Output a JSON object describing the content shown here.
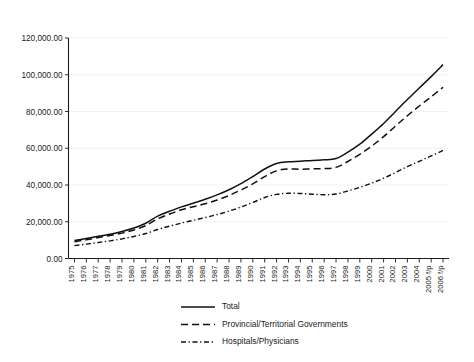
{
  "chart_data": {
    "type": "line",
    "title": "",
    "subtitle": "",
    "xlabel": "",
    "ylabel": "",
    "grid": "horizontal",
    "legend_position": "bottom-center",
    "ylim": [
      0,
      120000
    ],
    "ytick_labels": [
      "0.00",
      "20,000.00",
      "40,000.00",
      "60,000.00",
      "80,000.00",
      "100,000.00",
      "120,000.00"
    ],
    "ytick_values": [
      0,
      20000,
      40000,
      60000,
      80000,
      100000,
      120000
    ],
    "categories": [
      "1975",
      "1976",
      "1977",
      "1978",
      "1979",
      "1980",
      "1981",
      "1982",
      "1983",
      "1984",
      "1985",
      "1986",
      "1987",
      "1988",
      "1989",
      "1990",
      "1991",
      "1992",
      "1993",
      "1994",
      "1995",
      "1996",
      "1997",
      "1998",
      "1999",
      "2000",
      "2001",
      "2002",
      "2003",
      "2004",
      "2005 f/p",
      "2006 f/p"
    ],
    "series": [
      {
        "name": "Total",
        "style": "solid",
        "values": [
          9800,
          10900,
          12100,
          13200,
          14700,
          16600,
          19200,
          23100,
          25700,
          28100,
          30100,
          32200,
          34600,
          37400,
          40700,
          44600,
          48700,
          51700,
          52600,
          52900,
          53400,
          53700,
          54400,
          57900,
          62200,
          67700,
          73500,
          80000,
          86500,
          92800,
          99000,
          105500
        ]
      },
      {
        "name": "Provincial/Territorial Governments",
        "style": "dashed",
        "values": [
          9100,
          10200,
          11400,
          12500,
          13800,
          15500,
          17900,
          21600,
          24200,
          26500,
          28200,
          29800,
          31800,
          34300,
          37300,
          40600,
          44600,
          47700,
          48700,
          48600,
          48800,
          48900,
          49600,
          52800,
          56700,
          61200,
          66300,
          72100,
          77700,
          83000,
          88000,
          93200
        ]
      },
      {
        "name": "Hospitals/Physicians",
        "style": "dashdot",
        "values": [
          7000,
          7800,
          8700,
          9600,
          10700,
          12000,
          13600,
          15800,
          17600,
          19300,
          20800,
          22300,
          23900,
          25800,
          28000,
          30500,
          33200,
          34900,
          35500,
          35400,
          35000,
          34700,
          35100,
          36800,
          38700,
          41000,
          43700,
          46800,
          50000,
          52900,
          55800,
          58800
        ]
      }
    ]
  },
  "legend": {
    "items": [
      {
        "label": "Total",
        "style": "solid"
      },
      {
        "label": "Provincial/Territorial Governments",
        "style": "dashed"
      },
      {
        "label": "Hospitals/Physicians",
        "style": "dashdot"
      }
    ]
  }
}
